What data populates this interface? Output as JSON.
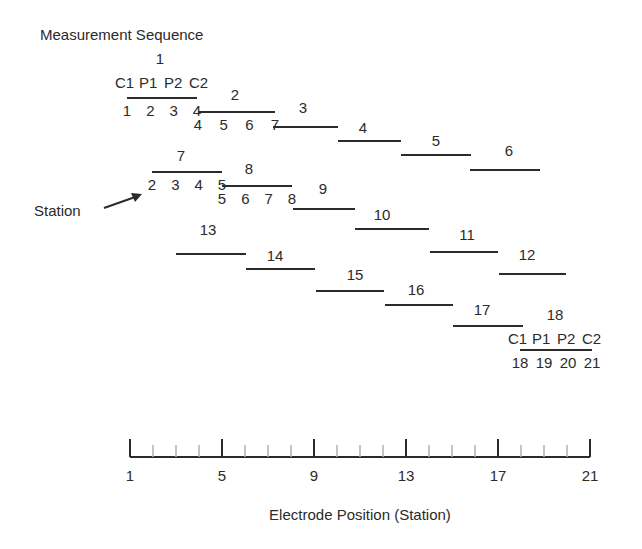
{
  "title": "Measurement Sequence",
  "station_annotation": "Station",
  "electrode_labels": [
    "C1",
    "P1",
    "P2",
    "C2"
  ],
  "axis": {
    "label": "Electrode Position (Station)",
    "min": 1,
    "max": 21,
    "major_ticks": [
      1,
      5,
      9,
      13,
      17,
      21
    ],
    "minor_ticks_every": 1
  },
  "measurements": [
    {
      "id": 1,
      "label": "1",
      "x1": 127,
      "x2": 197,
      "y": 98,
      "lx": 160,
      "ly": 64,
      "stations": [
        "1",
        "2",
        "3",
        "4"
      ]
    },
    {
      "id": 2,
      "label": "2",
      "x1": 198,
      "x2": 275,
      "y": 112,
      "lx": 235,
      "ly": 100,
      "stations": [
        "4",
        "5",
        "6",
        "7"
      ]
    },
    {
      "id": 3,
      "label": "3",
      "x1": 273,
      "x2": 338,
      "y": 127,
      "lx": 303,
      "ly": 113
    },
    {
      "id": 4,
      "label": "4",
      "x1": 338,
      "x2": 401,
      "y": 141,
      "lx": 363,
      "ly": 133
    },
    {
      "id": 5,
      "label": "5",
      "x1": 401,
      "x2": 471,
      "y": 155,
      "lx": 436,
      "ly": 146
    },
    {
      "id": 6,
      "label": "6",
      "x1": 470,
      "x2": 540,
      "y": 170,
      "lx": 509,
      "ly": 156
    },
    {
      "id": 7,
      "label": "7",
      "x1": 152,
      "x2": 222,
      "y": 172,
      "lx": 181,
      "ly": 161,
      "stations": [
        "2",
        "3",
        "4",
        "5"
      ]
    },
    {
      "id": 8,
      "label": "8",
      "x1": 222,
      "x2": 292,
      "y": 186,
      "lx": 249,
      "ly": 174,
      "stations": [
        "5",
        "6",
        "7",
        "8"
      ]
    },
    {
      "id": 9,
      "label": "9",
      "x1": 293,
      "x2": 355,
      "y": 209,
      "lx": 323,
      "ly": 194
    },
    {
      "id": 10,
      "label": "10",
      "x1": 355,
      "x2": 429,
      "y": 229,
      "lx": 382,
      "ly": 220
    },
    {
      "id": 11,
      "label": "11",
      "x1": 430,
      "x2": 498,
      "y": 252,
      "lx": 467,
      "ly": 240
    },
    {
      "id": 12,
      "label": "12",
      "x1": 499,
      "x2": 566,
      "y": 274,
      "lx": 527,
      "ly": 260
    },
    {
      "id": 13,
      "label": "13",
      "x1": 176,
      "x2": 246,
      "y": 254,
      "lx": 208,
      "ly": 235
    },
    {
      "id": 14,
      "label": "14",
      "x1": 246,
      "x2": 315,
      "y": 269,
      "lx": 275,
      "ly": 261
    },
    {
      "id": 15,
      "label": "15",
      "x1": 316,
      "x2": 384,
      "y": 291,
      "lx": 355,
      "ly": 280
    },
    {
      "id": 16,
      "label": "16",
      "x1": 385,
      "x2": 453,
      "y": 305,
      "lx": 416,
      "ly": 295
    },
    {
      "id": 17,
      "label": "17",
      "x1": 453,
      "x2": 523,
      "y": 326,
      "lx": 482,
      "ly": 315
    },
    {
      "id": 18,
      "label": "18",
      "x1": 520,
      "x2": 592,
      "y": 350,
      "lx": 555,
      "ly": 320,
      "stations": [
        "18",
        "19",
        "20",
        "21"
      ]
    }
  ],
  "colors": {
    "ink": "#2b2b2b",
    "minor_tick": "#b0b0b0"
  }
}
